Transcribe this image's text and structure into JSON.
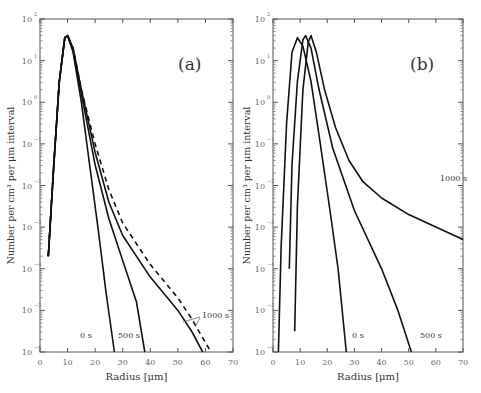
{
  "figure": {
    "ylabel": "Number per cm³ per μm interval",
    "xlabel": "Radius [μm]"
  },
  "chart_data": [
    {
      "type": "line",
      "panel": "(a)",
      "xlabel": "Radius [μm]",
      "ylabel": "Number per cm³ per μm interval",
      "xlim": [
        0,
        70
      ],
      "ylim_log10": [
        -6,
        2
      ],
      "yscale": "log",
      "xticks": [
        0,
        10,
        20,
        30,
        40,
        50,
        60,
        70
      ],
      "yticks": [
        "10^2",
        "10^1",
        "10^0",
        "10^-1",
        "10^-2",
        "10^-3",
        "10^-4",
        "10^-5",
        "10^-6"
      ],
      "series": [
        {
          "name": "0 s",
          "style": "solid",
          "points": [
            [
              3,
              -3.7
            ],
            [
              5,
              -1.5
            ],
            [
              7,
              0.5
            ],
            [
              9,
              1.55
            ],
            [
              10,
              1.6
            ],
            [
              12,
              1.2
            ],
            [
              15,
              0
            ],
            [
              18,
              -1.5
            ],
            [
              21,
              -3
            ],
            [
              24,
              -4.6
            ],
            [
              27,
              -6
            ]
          ]
        },
        {
          "name": "500 s",
          "style": "solid",
          "points": [
            [
              3,
              -3.7
            ],
            [
              5,
              -1.5
            ],
            [
              7,
              0.5
            ],
            [
              9,
              1.55
            ],
            [
              10,
              1.6
            ],
            [
              12,
              1.25
            ],
            [
              15,
              0.2
            ],
            [
              20,
              -1.5
            ],
            [
              25,
              -2.8
            ],
            [
              30,
              -3.8
            ],
            [
              35,
              -4.8
            ],
            [
              38,
              -6
            ]
          ]
        },
        {
          "name": "1000 s",
          "style": "solid",
          "points": [
            [
              3,
              -3.7
            ],
            [
              5,
              -1.5
            ],
            [
              7,
              0.5
            ],
            [
              9,
              1.55
            ],
            [
              10,
              1.6
            ],
            [
              12,
              1.3
            ],
            [
              15,
              0.3
            ],
            [
              20,
              -1.2
            ],
            [
              25,
              -2.4
            ],
            [
              30,
              -3.2
            ],
            [
              40,
              -4.2
            ],
            [
              50,
              -5
            ],
            [
              55,
              -5.5
            ],
            [
              59,
              -6
            ]
          ]
        },
        {
          "name": "1000 s (dashed)",
          "style": "dashed",
          "points": [
            [
              3,
              -3.7
            ],
            [
              5,
              -1.5
            ],
            [
              7,
              0.5
            ],
            [
              9,
              1.55
            ],
            [
              10,
              1.6
            ],
            [
              12,
              1.3
            ],
            [
              15,
              0.3
            ],
            [
              20,
              -1
            ],
            [
              25,
              -2.1
            ],
            [
              30,
              -2.9
            ],
            [
              40,
              -3.9
            ],
            [
              50,
              -4.7
            ],
            [
              55,
              -5.2
            ],
            [
              62,
              -6
            ]
          ]
        }
      ],
      "annotations": [
        "(a)",
        "0 s",
        "500 s",
        "1000 s"
      ]
    },
    {
      "type": "line",
      "panel": "(b)",
      "xlabel": "Radius [μm]",
      "ylabel": "Number per cm³ per μm interval",
      "xlim": [
        0,
        70
      ],
      "ylim_log10": [
        -6,
        2
      ],
      "yscale": "log",
      "xticks": [
        0,
        10,
        20,
        30,
        40,
        50,
        60,
        70
      ],
      "yticks": [
        "10^2",
        "10^1",
        "10^0",
        "10^-1",
        "10^-2",
        "10^-3",
        "10^-4",
        "10^-5",
        "10^-6"
      ],
      "series": [
        {
          "name": "0 s",
          "style": "solid",
          "points": [
            [
              2,
              -6
            ],
            [
              3,
              -3.5
            ],
            [
              5,
              -0.5
            ],
            [
              7,
              1.2
            ],
            [
              9,
              1.55
            ],
            [
              11,
              1.35
            ],
            [
              14,
              0.5
            ],
            [
              17,
              -0.8
            ],
            [
              21,
              -2.6
            ],
            [
              24,
              -4
            ],
            [
              27,
              -6
            ]
          ]
        },
        {
          "name": "500 s",
          "style": "solid",
          "points": [
            [
              6,
              -4
            ],
            [
              7,
              -1.5
            ],
            [
              9,
              0.5
            ],
            [
              11,
              1.5
            ],
            [
              12,
              1.6
            ],
            [
              14,
              1.3
            ],
            [
              17,
              0.3
            ],
            [
              22,
              -1.1
            ],
            [
              30,
              -2.6
            ],
            [
              40,
              -4
            ],
            [
              46,
              -5
            ],
            [
              51,
              -6
            ]
          ]
        },
        {
          "name": "1000 s",
          "style": "solid",
          "points": [
            [
              8,
              -5.5
            ],
            [
              9,
              -2.5
            ],
            [
              11,
              0.3
            ],
            [
              13,
              1.45
            ],
            [
              14,
              1.6
            ],
            [
              16,
              1.2
            ],
            [
              19,
              0.3
            ],
            [
              23,
              -0.6
            ],
            [
              28,
              -1.4
            ],
            [
              33,
              -1.9
            ],
            [
              40,
              -2.3
            ],
            [
              50,
              -2.7
            ],
            [
              60,
              -3
            ],
            [
              70,
              -3.3
            ]
          ]
        }
      ],
      "annotations": [
        "(b)",
        "0 s",
        "500 s",
        "1000 s"
      ]
    }
  ],
  "panels": [
    {
      "label": "(a)",
      "curve_labels": [
        "0 s",
        "500 s",
        "1000 s"
      ]
    },
    {
      "label": "(b)",
      "curve_labels": [
        "0 s",
        "500 s",
        "1000 s"
      ]
    }
  ]
}
